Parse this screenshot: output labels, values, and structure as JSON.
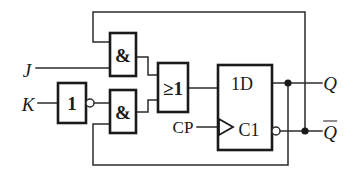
{
  "diagram": {
    "type": "logic-circuit-schematic",
    "line_color": "#2b2b2b",
    "box_color": "#1a1a1a",
    "background": "#ffffff"
  },
  "inputs": [
    {
      "id": "J",
      "label": "J",
      "x": 27,
      "y": 70
    },
    {
      "id": "K",
      "label": "K",
      "x": 28,
      "y": 104
    },
    {
      "id": "CP",
      "label": "CP",
      "x": 183,
      "y": 127
    }
  ],
  "outputs": [
    {
      "id": "Q",
      "label": "Q",
      "overbar": false,
      "x": 330,
      "y": 83
    },
    {
      "id": "Qbar",
      "label": "Q",
      "overbar": true,
      "x": 330,
      "y": 131
    }
  ],
  "gates": [
    {
      "id": "inverter",
      "symbol": "1",
      "kind": "not-gate",
      "box": {
        "x": 58,
        "y": 83,
        "w": 28,
        "h": 40
      },
      "label_x": 72,
      "label_y": 103,
      "output_bubble": {
        "cx": 90,
        "cy": 103,
        "r": 4
      }
    },
    {
      "id": "and-top",
      "symbol": "&",
      "kind": "and-gate",
      "box": {
        "x": 110,
        "y": 33,
        "w": 26,
        "h": 43
      },
      "label_x": 123,
      "label_y": 55
    },
    {
      "id": "and-bottom",
      "symbol": "&",
      "kind": "and-gate",
      "box": {
        "x": 110,
        "y": 90,
        "w": 26,
        "h": 43
      },
      "label_x": 123,
      "label_y": 112
    },
    {
      "id": "or-gate",
      "symbol": "≥1",
      "kind": "or-gate",
      "box": {
        "x": 158,
        "y": 63,
        "w": 30,
        "h": 49
      },
      "label_x": 173,
      "label_y": 88
    },
    {
      "id": "d-flipflop",
      "symbol": "",
      "kind": "d-flip-flop",
      "box": {
        "x": 218,
        "y": 65,
        "w": 54,
        "h": 85
      },
      "data_label": "1D",
      "data_label_x": 242,
      "data_label_y": 84,
      "clock_label": "C1",
      "clock_label_x": 249,
      "clock_label_y": 130,
      "output_bubble": {
        "cx": 276,
        "cy": 131,
        "r": 4
      }
    }
  ],
  "junctions": [
    {
      "id": "q-tap",
      "cx": 288,
      "cy": 83,
      "r": 3.6
    },
    {
      "id": "qbar-tap",
      "cx": 305,
      "cy": 131,
      "r": 3.6
    }
  ],
  "wires": [
    {
      "id": "j-input-wire",
      "points": "36,68 110,68"
    },
    {
      "id": "k-input-wire",
      "points": "38,103 58,103"
    },
    {
      "id": "inverter-to-and-bottom",
      "points": "94,103 110,103"
    },
    {
      "id": "and-top-out-to-or",
      "points": "136,57 148,57 148,75 158,75"
    },
    {
      "id": "and-bottom-out-to-or",
      "points": "136,112 148,112 148,100 158,100"
    },
    {
      "id": "or-out-to-ff",
      "points": "188,88 218,88"
    },
    {
      "id": "cp-to-ff",
      "points": "197,127 218,127"
    },
    {
      "id": "ff-q-out",
      "points": "272,83 330,83"
    },
    {
      "id": "ff-qbar-out",
      "points": "280,131 330,131"
    },
    {
      "id": "qbar-feedback-top",
      "points": "305,131 305,12 93,12 93,42 110,42"
    },
    {
      "id": "q-feedback-bottom",
      "points": "288,83 288,165 93,165 93,124 110,124"
    }
  ],
  "clock_triangle": {
    "points": "219,119 233,127 219,135"
  }
}
